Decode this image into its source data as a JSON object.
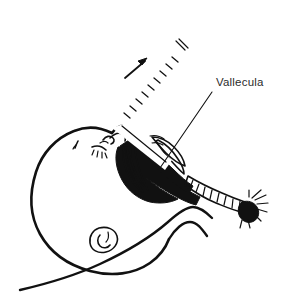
{
  "figure": {
    "kind": "medical-line-illustration",
    "background_color": "#ffffff",
    "ink_color": "#111111",
    "label_color": "#2b2b2b"
  },
  "annotations": [
    {
      "id": "vallecula",
      "text": "Vallecula",
      "text_x": 216,
      "text_y": 86,
      "leader_from_x": 212,
      "leader_from_y": 92,
      "leader_to_x": 160,
      "leader_to_y": 168
    }
  ],
  "direction_indicator": {
    "name": "lift-arrow",
    "meaning": "direction of laryngoscope lift",
    "tail_x": 125,
    "tail_y": 78,
    "tip_x": 147,
    "tip_y": 59
  },
  "instrument": {
    "name": "laryngoscope",
    "handle_label": "handle with knurled grip",
    "blade_label": "blade tip seated in vallecula",
    "knurl_count": 9
  },
  "anatomy": [
    {
      "name": "head-outline",
      "label": "infant head"
    },
    {
      "name": "eyebrow",
      "label": "eyebrow"
    },
    {
      "name": "eye-closed",
      "label": "closed eye with lashes"
    },
    {
      "name": "ear",
      "label": "ear"
    },
    {
      "name": "nose",
      "label": "nose"
    },
    {
      "name": "oral-pharyngeal-cavity",
      "label": "oral and pharyngeal cavity"
    },
    {
      "name": "tongue",
      "label": "tongue"
    },
    {
      "name": "epiglottis",
      "label": "epiglottis"
    },
    {
      "name": "trachea",
      "label": "trachea with cartilage rings"
    },
    {
      "name": "lung-bifurcation",
      "label": "tracheal bifurcation"
    },
    {
      "name": "neck-shoulder",
      "label": "neck and shoulder contour"
    }
  ]
}
